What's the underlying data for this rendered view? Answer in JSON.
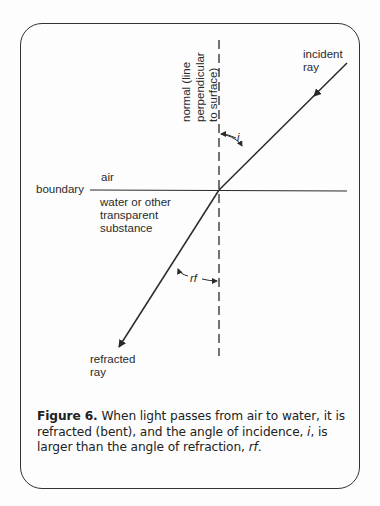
{
  "diagram": {
    "labels": {
      "normal_line1": "normal (line",
      "normal_line2": "perpendicular",
      "normal_line3": "to surface)",
      "incident_line1": "incident",
      "incident_line2": "ray",
      "air": "air",
      "boundary": "boundary",
      "water_line1": "water or other",
      "water_line2": "transparent",
      "water_line3": "substance",
      "angle_i": "i",
      "angle_rf": "rf",
      "refracted_line1": "refracted",
      "refracted_line2": "ray"
    },
    "colors": {
      "stroke": "#2a2a2a",
      "background": "#fdfdfd"
    }
  },
  "caption": {
    "figure_label": "Figure 6.",
    "text_1": " When light passes from air to water, it is refracted (bent), and the angle of incidence, ",
    "italic_i": "i",
    "text_2": ", is larger than the angle of refraction, ",
    "italic_rf": "rf",
    "text_3": "."
  }
}
